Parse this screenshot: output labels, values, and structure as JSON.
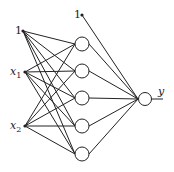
{
  "diagram": {
    "type": "neural-network",
    "input_layer": {
      "nodes": [
        {
          "label": "1",
          "sub": "",
          "kind": "bias"
        },
        {
          "label": "x",
          "sub": "1",
          "kind": "input"
        },
        {
          "label": "x",
          "sub": "2",
          "kind": "input"
        }
      ]
    },
    "hidden_layer": {
      "count": 5
    },
    "hidden_bias": {
      "label": "1"
    },
    "output_layer": {
      "label": "y"
    },
    "colors": {
      "line": "#222222",
      "node_fill": "#ffffff",
      "background": "#ffffff"
    }
  }
}
